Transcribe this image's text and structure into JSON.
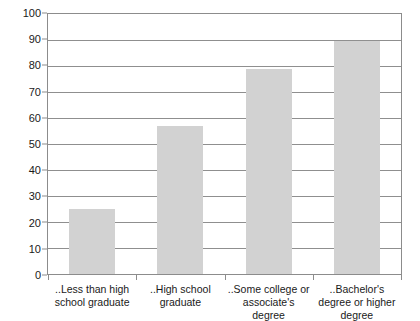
{
  "chart_data": {
    "type": "bar",
    "title": "",
    "subtitle": "",
    "xlabel": "",
    "ylabel": "",
    "categories": [
      "..Less than high school graduate",
      "..High school graduate",
      "..Some college or associate's degree",
      "..Bachelor's degree or higher degree"
    ],
    "values": [
      25,
      57,
      79,
      89.5
    ],
    "ylim": [
      0,
      100
    ],
    "ytick_labels": [
      "0",
      "10",
      "20",
      "30",
      "40",
      "50",
      "60",
      "70",
      "80",
      "90",
      "100"
    ],
    "ytick_values": [
      0,
      10,
      20,
      30,
      40,
      50,
      60,
      70,
      80,
      90,
      100
    ],
    "grid": true,
    "legend": false,
    "legend_position": "none",
    "bar_color": "#d2d2d2",
    "axis_color": "#8c8c8c",
    "gridline_color": "#8f8f8f",
    "annotations": []
  }
}
